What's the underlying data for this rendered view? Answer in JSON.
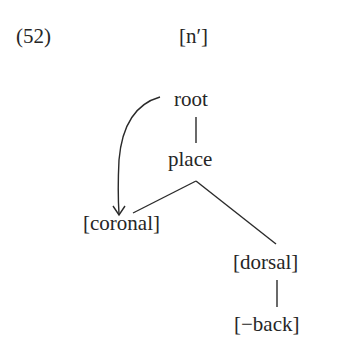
{
  "example": {
    "number": "(52)",
    "segment": "[n′]"
  },
  "tree": {
    "nodes": [
      {
        "id": "root",
        "label": "root"
      },
      {
        "id": "place",
        "label": "place"
      },
      {
        "id": "coronal",
        "label": "[coronal]"
      },
      {
        "id": "dorsal",
        "label": "[dorsal]"
      },
      {
        "id": "back",
        "label": "[−back]"
      }
    ],
    "edges": [
      {
        "from": "root",
        "to": "place",
        "type": "line"
      },
      {
        "from": "place",
        "to": "coronal",
        "type": "line"
      },
      {
        "from": "place",
        "to": "dorsal",
        "type": "line"
      },
      {
        "from": "dorsal",
        "to": "back",
        "type": "line"
      },
      {
        "from": "root",
        "to": "coronal",
        "type": "curved-arrow"
      }
    ]
  }
}
